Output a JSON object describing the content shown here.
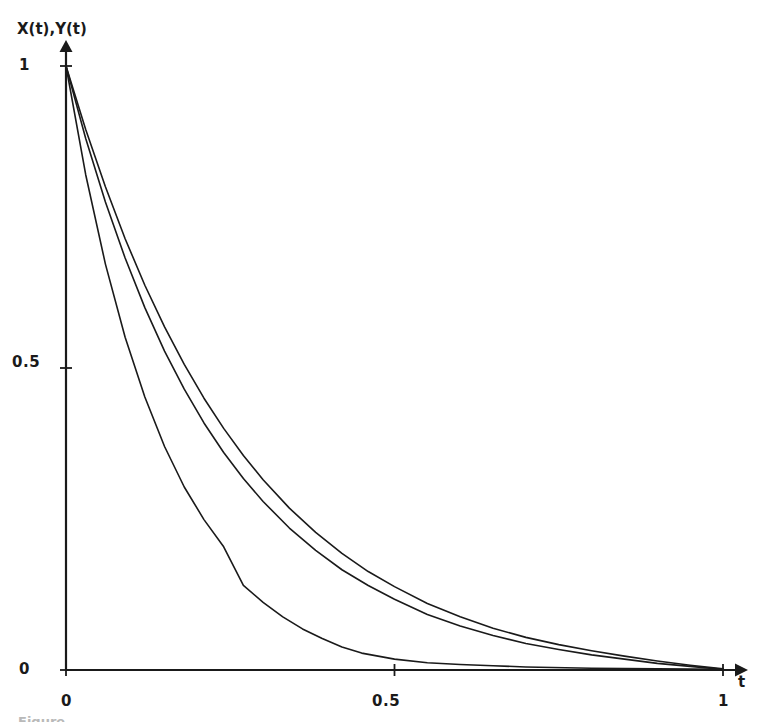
{
  "figure": {
    "background_color": "#ffffff",
    "ink_color": "#1a1a1a",
    "caption_partial": "Figure"
  },
  "axes": {
    "y_axis_title": "X(t),Y(t)",
    "x_axis_title": "t",
    "y_ticks": [
      "0",
      "0.5",
      "1"
    ],
    "x_ticks": [
      "0",
      "0.5",
      "1"
    ],
    "y_tick_1": "1",
    "y_tick_05": "0.5",
    "y_tick_0": "0",
    "x_tick_0": "0",
    "x_tick_05": "0.5",
    "x_tick_1": "1"
  },
  "chart_data": {
    "type": "line",
    "title": "",
    "subtitle": "",
    "xlabel": "t",
    "ylabel": "X(t),Y(t)",
    "xlim": [
      0,
      1
    ],
    "ylim": [
      0,
      1
    ],
    "xticks": [
      0,
      0.5,
      1
    ],
    "yticks": [
      0,
      0.5,
      1
    ],
    "xticklabels": [
      "0",
      "0.5",
      "1"
    ],
    "yticklabels": [
      "0",
      "0.5",
      "1"
    ],
    "grid": false,
    "legend": null,
    "legend_position": "none",
    "annotations": [],
    "axis_style": "arrow-tipped open axes, no box frame",
    "line_color": "#1a1a1a",
    "line_width": 1.6,
    "series": [
      {
        "name": "upper curve",
        "comment": "slowest decay, uppermost of the three",
        "x": [
          0.0,
          0.03,
          0.06,
          0.09,
          0.12,
          0.15,
          0.18,
          0.21,
          0.24,
          0.27,
          0.3,
          0.34,
          0.38,
          0.42,
          0.46,
          0.5,
          0.55,
          0.6,
          0.65,
          0.7,
          0.75,
          0.8,
          0.85,
          0.9,
          0.95,
          1.0
        ],
        "y": [
          1.0,
          0.895,
          0.8,
          0.714,
          0.637,
          0.568,
          0.506,
          0.45,
          0.4,
          0.355,
          0.315,
          0.268,
          0.228,
          0.193,
          0.163,
          0.138,
          0.11,
          0.088,
          0.069,
          0.054,
          0.042,
          0.032,
          0.023,
          0.015,
          0.008,
          0.002
        ]
      },
      {
        "name": "middle curve",
        "comment": "slightly faster decay, just below the upper curve",
        "x": [
          0.0,
          0.03,
          0.06,
          0.09,
          0.12,
          0.15,
          0.18,
          0.21,
          0.24,
          0.27,
          0.3,
          0.34,
          0.38,
          0.42,
          0.46,
          0.5,
          0.55,
          0.6,
          0.65,
          0.7,
          0.75,
          0.8,
          0.85,
          0.9,
          0.95,
          1.0
        ],
        "y": [
          1.0,
          0.88,
          0.775,
          0.682,
          0.6,
          0.528,
          0.465,
          0.409,
          0.36,
          0.317,
          0.279,
          0.235,
          0.198,
          0.166,
          0.14,
          0.117,
          0.092,
          0.073,
          0.057,
          0.044,
          0.034,
          0.025,
          0.018,
          0.011,
          0.006,
          0.001
        ]
      },
      {
        "name": "lower curve",
        "comment": "fastest decay with a visible kink near t=0.27; reaches the axis near t=0.45",
        "x": [
          0.0,
          0.03,
          0.06,
          0.09,
          0.12,
          0.15,
          0.18,
          0.21,
          0.24,
          0.27,
          0.3,
          0.33,
          0.36,
          0.39,
          0.42,
          0.45,
          0.5,
          0.55,
          0.6,
          0.65,
          0.7,
          0.8,
          0.9,
          1.0
        ],
        "y": [
          1.0,
          0.82,
          0.672,
          0.551,
          0.452,
          0.37,
          0.303,
          0.249,
          0.204,
          0.14,
          0.112,
          0.088,
          0.068,
          0.052,
          0.038,
          0.028,
          0.018,
          0.012,
          0.009,
          0.007,
          0.005,
          0.003,
          0.002,
          0.001
        ]
      }
    ]
  }
}
